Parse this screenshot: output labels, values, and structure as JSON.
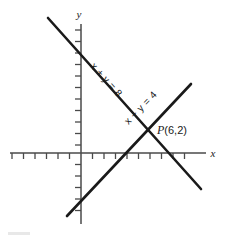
{
  "figure": {
    "kind": "coordinate-graph",
    "background_color": "#ffffff",
    "ink_color": "#1a1a1a",
    "axis_color": "#4a4a4a",
    "axes": {
      "x_axis_label": "x",
      "y_axis_label": "y",
      "origin_px": [
        81,
        153
      ],
      "tick_spacing_px": 11.5,
      "tick_length_px": 5,
      "x_axis_start_px": 10,
      "x_axis_end_px": 206,
      "y_axis_top_px": 24,
      "y_axis_bottom_px": 224,
      "x_tick_offsets": [
        -6,
        -5,
        -4,
        -3,
        -2,
        -1,
        1,
        2,
        3,
        4,
        5,
        6,
        7,
        8,
        9,
        10
      ],
      "y_tick_offsets": [
        -5,
        -4,
        -3,
        -2,
        -1,
        1,
        2,
        3,
        4,
        5,
        6,
        7,
        8,
        9,
        10,
        11
      ]
    },
    "lines": [
      {
        "id": "line-sum",
        "label": "x + y = 8",
        "equation": "x + y = 8",
        "slope": -1,
        "intercept": 8,
        "start_px": [
          48,
          18
        ],
        "end_px": [
          201,
          189
        ],
        "label_anchor_px": [
          104,
          82
        ],
        "label_rotation_deg": 48,
        "stroke_width": 2.6
      },
      {
        "id": "line-difference",
        "label": "x - y = 4",
        "equation": "x − y = 4",
        "slope": 1,
        "intercept": -4,
        "start_px": [
          67,
          216
        ],
        "end_px": [
          191,
          84
        ],
        "label_anchor_px": [
          140,
          110
        ],
        "label_rotation_deg": -46,
        "stroke_width": 2.6
      }
    ],
    "points": [
      {
        "id": "intersection",
        "label_italic": "P",
        "label_plain": "(6,2)",
        "label_full": "P(6,2)",
        "coords": [
          6,
          2
        ],
        "position_px": [
          150,
          130
        ],
        "label_position_px": [
          157,
          134
        ]
      }
    ]
  }
}
